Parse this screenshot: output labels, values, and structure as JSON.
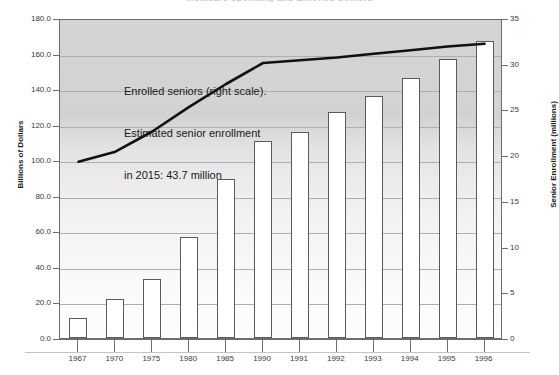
{
  "chart_data": {
    "type": "bar",
    "title": "Medicare Spending and Enrolled Seniors",
    "xlabel": "",
    "ylabel": "Billions of Dollars",
    "y2label": "Senior Enrollment (millions)",
    "ylim": [
      0,
      180
    ],
    "y2lim": [
      0,
      35
    ],
    "yticks": [
      "0.0",
      "20.0",
      "40.0",
      "60.0",
      "80.0",
      "100.0",
      "120.0",
      "140.0",
      "160.0",
      "180.0"
    ],
    "y2ticks": [
      "0",
      "5",
      "10",
      "15",
      "20",
      "25",
      "30",
      "35"
    ],
    "grid": true,
    "legend_position": "none",
    "categories": [
      "1967",
      "1970",
      "1975",
      "1980",
      "1985",
      "1990",
      "1991",
      "1992",
      "1993",
      "1994",
      "1995",
      "1996"
    ],
    "series": [
      {
        "name": "Medicare Spending",
        "type": "bar",
        "axis": "left",
        "unit": "Billions of Dollars",
        "values": [
          11.0,
          22.0,
          33.0,
          57.0,
          89.5,
          111.0,
          116.0,
          127.0,
          136.0,
          146.0,
          157.0,
          167.0
        ]
      },
      {
        "name": "Enrolled seniors (right scale)",
        "type": "line",
        "axis": "right",
        "unit": "millions",
        "values": [
          19.5,
          20.6,
          22.8,
          25.5,
          28.0,
          30.3,
          30.6,
          30.9,
          31.3,
          31.7,
          32.1,
          32.4
        ]
      }
    ],
    "annotations": [
      {
        "name": "series-callout",
        "lines": [
          "Enrolled seniors (right scale).",
          "Estimated senior enrollment",
          "in 2015: 43.7 million"
        ]
      }
    ],
    "colors": {
      "bar_fill": "#ffffff",
      "bar_stroke": "#5a5a5a",
      "line": "#111111",
      "plot_bg_top": "#d4d4d4",
      "plot_bg_bottom": "#fdfdfd",
      "gridline": "#aeaeae",
      "axis": "#6d6d6d",
      "text": "#1a1a1a"
    }
  }
}
